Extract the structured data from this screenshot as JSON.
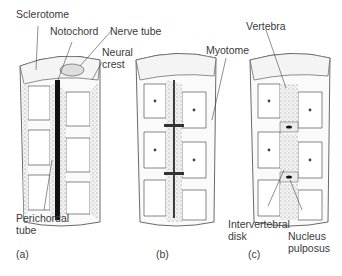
{
  "figure": {
    "panels": [
      {
        "id": "a",
        "label": "(a)"
      },
      {
        "id": "b",
        "label": "(b)"
      },
      {
        "id": "c",
        "label": "(c)"
      }
    ],
    "labels": {
      "sclerotome": "Sclerotome",
      "notochord": "Notochord",
      "nerve_tube": "Nerve tube",
      "neural_crest_1": "Neural",
      "neural_crest_2": "crest",
      "perichordal_1": "Perichordal",
      "perichordal_2": "tube",
      "myotome": "Myotome",
      "vertebra": "Vertebra",
      "intervertebral_1": "Intervertebral",
      "intervertebral_2": "disk",
      "nucleus_1": "Nucleus",
      "nucleus_2": "pulposus"
    }
  }
}
